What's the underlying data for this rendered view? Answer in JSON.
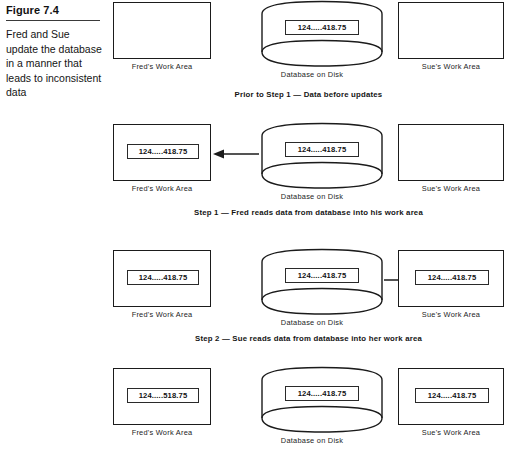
{
  "figure": {
    "number": "Figure 7.4",
    "caption": "Fred and Sue update the database in a manner that leads to inconsistent data"
  },
  "labels": {
    "fred_work_area": "Fred's Work Area",
    "sue_work_area": "Sue's Work Area",
    "database_on_disk": "Database on Disk"
  },
  "values": {
    "original": "124.....418.75",
    "updated": "124.....518.75"
  },
  "rows": [
    {
      "id": "row-prior",
      "caption": "Prior to Step 1 — Data before updates",
      "fred_value": "",
      "db_value": "124.....418.75",
      "sue_value": "",
      "arrow": "none"
    },
    {
      "id": "row-step-1",
      "caption": "Step 1 — Fred reads data from database into his work area",
      "fred_value": "124.....418.75",
      "db_value": "124.....418.75",
      "sue_value": "",
      "arrow": "left"
    },
    {
      "id": "row-step-2",
      "caption": "Step 2 — Sue reads data from database into her work area",
      "fred_value": "124.....418.75",
      "db_value": "124.....418.75",
      "sue_value": "124.....418.75",
      "arrow": "right"
    },
    {
      "id": "row-step-3",
      "caption": "",
      "fred_value": "124.....518.75",
      "db_value": "124.....418.75",
      "sue_value": "124.....418.75",
      "arrow": "none"
    }
  ],
  "colors": {
    "ink": "#1b1b1b",
    "background": "#ffffff",
    "rule": "#3a3a3a"
  }
}
